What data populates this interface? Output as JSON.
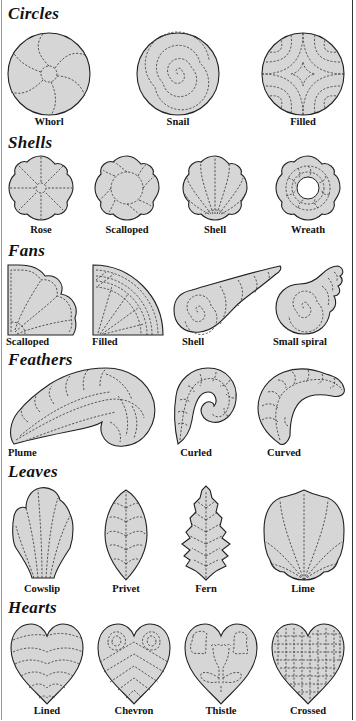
{
  "sections": [
    {
      "title": "Circles",
      "items": [
        {
          "label": "Whorl"
        },
        {
          "label": "Snail"
        },
        {
          "label": "Filled"
        }
      ]
    },
    {
      "title": "Shells",
      "items": [
        {
          "label": "Rose"
        },
        {
          "label": "Scalloped"
        },
        {
          "label": "Shell"
        },
        {
          "label": "Wreath"
        }
      ]
    },
    {
      "title": "Fans",
      "items": [
        {
          "label": "Scalloped"
        },
        {
          "label": "Filled"
        },
        {
          "label": "Shell"
        },
        {
          "label": "Small spiral"
        }
      ]
    },
    {
      "title": "Feathers",
      "items": [
        {
          "label": "Plume"
        },
        {
          "label": "Curled"
        },
        {
          "label": "Curved"
        }
      ]
    },
    {
      "title": "Leaves",
      "items": [
        {
          "label": "Cowslip"
        },
        {
          "label": "Privet"
        },
        {
          "label": "Fern"
        },
        {
          "label": "Lime"
        }
      ]
    },
    {
      "title": "Hearts",
      "items": [
        {
          "label": "Lined"
        },
        {
          "label": "Chevron"
        },
        {
          "label": "Thistle"
        },
        {
          "label": "Crossed"
        }
      ]
    }
  ],
  "colors": {
    "shape_fill": "#d6d6d6",
    "outline": "#222222",
    "quilting_line": "#333333",
    "background": "#ffffff"
  }
}
